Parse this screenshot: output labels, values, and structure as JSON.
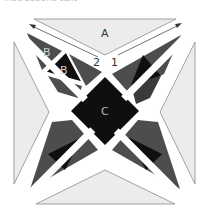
{
  "caption_fragment": "instructions text",
  "diagram": {
    "title": "",
    "labels": {
      "top_triangle": "A",
      "outer_b": "B",
      "inner_b": "B",
      "center_square": "C",
      "arrow_left": "2",
      "arrow_right": "1"
    },
    "colors": {
      "background": "#ffffff",
      "light_piece": "#ececec",
      "light_outline": "#8c8c8c",
      "mid_gray": "#4d4d4d",
      "dark_gray": "#1a1a1a",
      "black": "#0f0f0f",
      "label_light": "#d0d0d0",
      "label_dark": "#333333"
    },
    "pieces": [
      {
        "id": "A",
        "shape": "triangle",
        "position": "top",
        "fill": "light"
      },
      {
        "id": "side-left",
        "shape": "triangle",
        "position": "left",
        "fill": "light"
      },
      {
        "id": "side-right",
        "shape": "triangle",
        "position": "right",
        "fill": "light"
      },
      {
        "id": "bottom",
        "shape": "triangle",
        "position": "bottom",
        "fill": "light"
      },
      {
        "id": "B-outer",
        "shape": "triangle",
        "position": "top-left",
        "fill": "mid"
      },
      {
        "id": "B-inner",
        "shape": "triangle",
        "position": "top-left",
        "fill": "black"
      },
      {
        "id": "C",
        "shape": "square-on-point",
        "position": "center",
        "fill": "black"
      }
    ]
  }
}
